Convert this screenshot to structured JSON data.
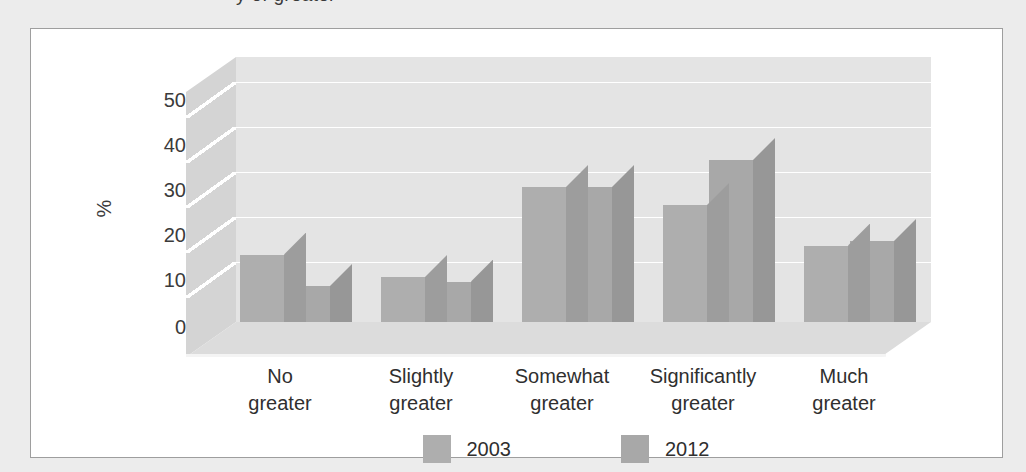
{
  "page": {
    "caption_descender_text": "y of greater",
    "background_color": "#ececec",
    "panel_background": "#ffffff",
    "panel_border_color": "#9e9e9e"
  },
  "chart_data": {
    "type": "bar",
    "title": "",
    "subtitle": "",
    "xlabel": "",
    "ylabel": "%",
    "ylim": [
      0,
      50
    ],
    "yticks": [
      0,
      10,
      20,
      30,
      40,
      50
    ],
    "ytick_labels": [
      "0",
      "10",
      "20",
      "30",
      "40",
      "50"
    ],
    "grid": true,
    "grid_axis": "y",
    "three_d": true,
    "legend_position": "bottom-center",
    "categories": [
      "No\ngreater",
      "Slightly\ngreater",
      "Somewhat\ngreater",
      "Significantly\ngreater",
      "Much\ngreater"
    ],
    "category_lines": [
      [
        "No",
        "greater"
      ],
      [
        "Slightly",
        "greater"
      ],
      [
        "Somewhat",
        "greater"
      ],
      [
        "Significantly",
        "greater"
      ],
      [
        "Much",
        "greater"
      ]
    ],
    "series": [
      {
        "name": "2003",
        "color": "#aeaeae",
        "values": [
          15,
          10,
          30,
          26,
          17
        ]
      },
      {
        "name": "2012",
        "color": "#a8a8a8",
        "values": [
          8,
          9,
          30,
          36,
          18
        ]
      }
    ]
  },
  "legend": {
    "entries": [
      {
        "label": "2003",
        "color": "#aeaeae"
      },
      {
        "label": "2012",
        "color": "#a8a8a8"
      }
    ]
  }
}
